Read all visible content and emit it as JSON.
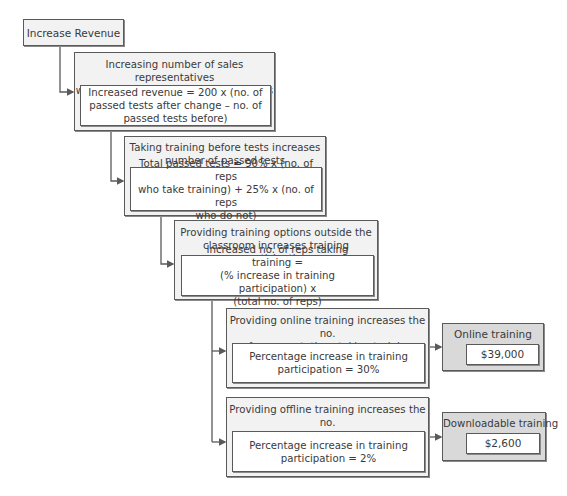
{
  "diagram": {
    "root": {
      "label": "Increase Revenue"
    },
    "nodes": [
      {
        "title": "Increasing number of sales representatives who have passed tests increases sales",
        "title_lines": [
          "Increasing number of sales representatives",
          "who have passed tests increases sales"
        ],
        "formula_lines": [
          "Increased revenue = 200 x (no. of",
          "passed tests after change – no. of",
          "passed tests before)"
        ]
      },
      {
        "title_lines": [
          "Taking training before tests increases",
          "number of passed tests"
        ],
        "formula_lines": [
          "Total passed tests = 90% x (no. of reps",
          "who take training) + 25% x (no. of reps",
          "who do not)"
        ]
      },
      {
        "title_lines": [
          "Providing training options outside the",
          "classroom increases training participation"
        ],
        "formula_lines": [
          "Increased no. of reps taking training =",
          "(% increase in training participation) x",
          "(total no. of reps)"
        ]
      },
      {
        "title_lines": [
          "Providing online training increases the no.",
          "of representatives taking training"
        ],
        "formula_lines": [
          "Percentage increase in training",
          "participation = 30%"
        ]
      },
      {
        "title_lines": [
          "Providing offline training increases the no.",
          "of representatives taking training"
        ],
        "formula_lines": [
          "Percentage increase in training",
          "participation = 2%"
        ]
      }
    ],
    "results": [
      {
        "label": "Online training",
        "value": "$39,000"
      },
      {
        "label": "Downloadable training",
        "value": "$2,600"
      }
    ],
    "colors": {
      "border": "#5a5a5a",
      "node_fill": "#f2f2f2",
      "result_fill": "#d9d9d9",
      "inner_fill": "#ffffff",
      "connector": "#5a5a5a"
    }
  }
}
